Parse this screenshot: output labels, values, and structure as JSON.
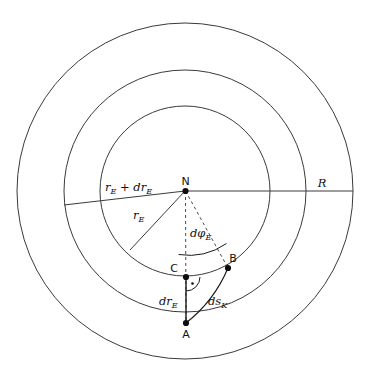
{
  "figure": {
    "background_color": "#ffffff",
    "stroke_color": "#3a3a3a",
    "accent_color": "#1a1a1a",
    "width": 365,
    "height": 376
  },
  "labels": {
    "center_point": "N",
    "point_a": "A",
    "point_b": "B",
    "point_c": "C",
    "radius_outer": "R",
    "radius_inner_base": "r",
    "radius_inner_sub": "E",
    "radius_outer_sum_prefix": "r",
    "radius_outer_sum_sub1": "E",
    "radius_outer_sum_plus": " + ",
    "radius_outer_sum_d": "dr",
    "radius_outer_sum_sub2": "E",
    "dr_base": "dr",
    "dr_sub": "E",
    "dphi_base": "dφ",
    "dphi_sub": "E",
    "dsk_base": "ds",
    "dsk_sub": "K"
  },
  "geometry": {
    "center_x": 185,
    "center_y": 191,
    "circle_outer_radius": 168,
    "circle_middle_radius": 121,
    "circle_inner_radius": 85,
    "point_a_x": 186,
    "point_a_y": 323,
    "point_b_x": 228,
    "point_b_y": 268,
    "point_c_x": 186,
    "point_c_y": 277,
    "angle_dphi_degrees": 38
  }
}
